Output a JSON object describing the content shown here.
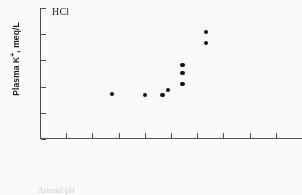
{
  "chart_data": {
    "type": "scatter",
    "title": "",
    "panel_label": "HCl",
    "xlabel": "",
    "ylabel": "Plasma K+, meq/L",
    "ylabel_prefix": "Plasma K",
    "ylabel_superscript": "+",
    "ylabel_suffix": ", meq/L",
    "ylim": [
      3.0,
      5.5
    ],
    "yticks": [
      3.0,
      3.5,
      4.0,
      4.5,
      5.0,
      5.5
    ],
    "ytick_labels": [
      "3.0",
      "3.5",
      "4.0",
      "4.5",
      "5.0",
      "5.5"
    ],
    "xlim": [
      0,
      10
    ],
    "xticks": [
      1,
      2,
      3,
      4,
      5,
      6,
      7,
      8,
      9,
      10
    ],
    "xtick_labels": [
      "",
      "",
      "",
      "",
      "",
      "",
      "",
      "",
      "",
      ""
    ],
    "grid": false,
    "legend": null,
    "marker": "filled-circle",
    "marker_color": "#0d0d0d",
    "axis_color": "#4d4d4d",
    "background": "#ffffff",
    "points": [
      {
        "x": 2.74,
        "y": 3.86
      },
      {
        "x": 4.0,
        "y": 3.84
      },
      {
        "x": 4.67,
        "y": 3.84
      },
      {
        "x": 4.89,
        "y": 3.94
      },
      {
        "x": 5.44,
        "y": 4.05
      },
      {
        "x": 5.44,
        "y": 4.26
      },
      {
        "x": 5.44,
        "y": 4.41
      },
      {
        "x": 6.33,
        "y": 4.83
      },
      {
        "x": 6.33,
        "y": 5.04
      }
    ]
  },
  "caption": {
    "text": "Arterial pH"
  }
}
